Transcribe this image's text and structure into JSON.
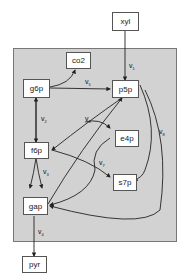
{
  "nodes": {
    "xyl": "xyl",
    "co2": "co2",
    "g6p": "g6p",
    "p5p": "p5p",
    "f6p": "f6p",
    "e4p": "e4p",
    "s7p": "s7p",
    "gap": "gap",
    "pyr": "pyr"
  },
  "reactions": {
    "v1": {
      "base": "v",
      "sub": "1"
    },
    "v2": {
      "base": "v",
      "sub": "2"
    },
    "v3": {
      "base": "v",
      "sub": "3"
    },
    "v4": {
      "base": "v",
      "sub": "4"
    },
    "v5": {
      "base": "v",
      "sub": "5"
    },
    "v6": {
      "base": "v",
      "sub": "6"
    },
    "v7": {
      "base": "v",
      "sub": "7"
    },
    "v8": {
      "base": "v",
      "sub": "8"
    }
  },
  "colors": {
    "panel": "#d2d2d2",
    "node_fill": "#ffffff",
    "stroke": "#222222"
  }
}
